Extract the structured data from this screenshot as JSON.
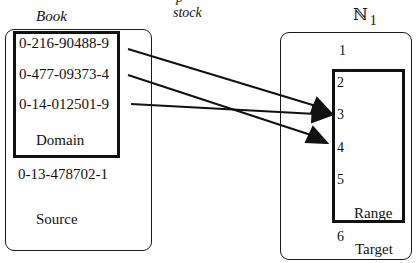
{
  "diagram": {
    "type": "function-mapping",
    "top_labels": {
      "source_set_name": "Book",
      "function_name_partial": "stock",
      "target_set_name": "ℕ",
      "target_set_subscript": "1"
    },
    "source": {
      "label": "Source",
      "domain_label": "Domain",
      "domain_elements": [
        "0-216-90488-9",
        "0-477-09373-4",
        "0-14-012501-9"
      ],
      "other_elements": [
        "0-13-478702-1"
      ]
    },
    "target": {
      "label": "Target",
      "range_label": "Range",
      "range_elements": [
        "2",
        "3",
        "4",
        "5"
      ],
      "other_elements": [
        "1",
        "6"
      ]
    },
    "mappings": [
      {
        "from": "0-216-90488-9",
        "to": "3"
      },
      {
        "from": "0-477-09373-4",
        "to": "4"
      },
      {
        "from": "0-14-012501-9",
        "to": "3"
      }
    ]
  }
}
